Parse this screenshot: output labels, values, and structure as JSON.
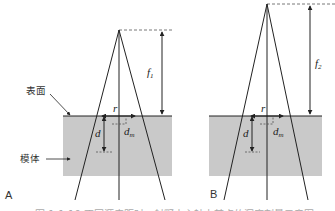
{
  "figure": {
    "panels": [
      {
        "id": "A",
        "label": "A",
        "focal_label": "f",
        "focal_sub": "1",
        "radius_label": "r",
        "depth_label": "d",
        "dm_label": "d",
        "dm_sub": "m",
        "surface_label": "表面",
        "phantom_label": "模体"
      },
      {
        "id": "B",
        "label": "B",
        "focal_label": "f",
        "focal_sub": "2",
        "radius_label": "r",
        "depth_label": "d",
        "dm_label": "d",
        "dm_sub": "m"
      }
    ],
    "caption": "图 1-1-10 不同源皮距时，射野中心轴上某点的深度剂量示意图"
  },
  "colors": {
    "phantom_fill": "#c9c9c9",
    "line": "#222222",
    "dashed": "#555555"
  }
}
